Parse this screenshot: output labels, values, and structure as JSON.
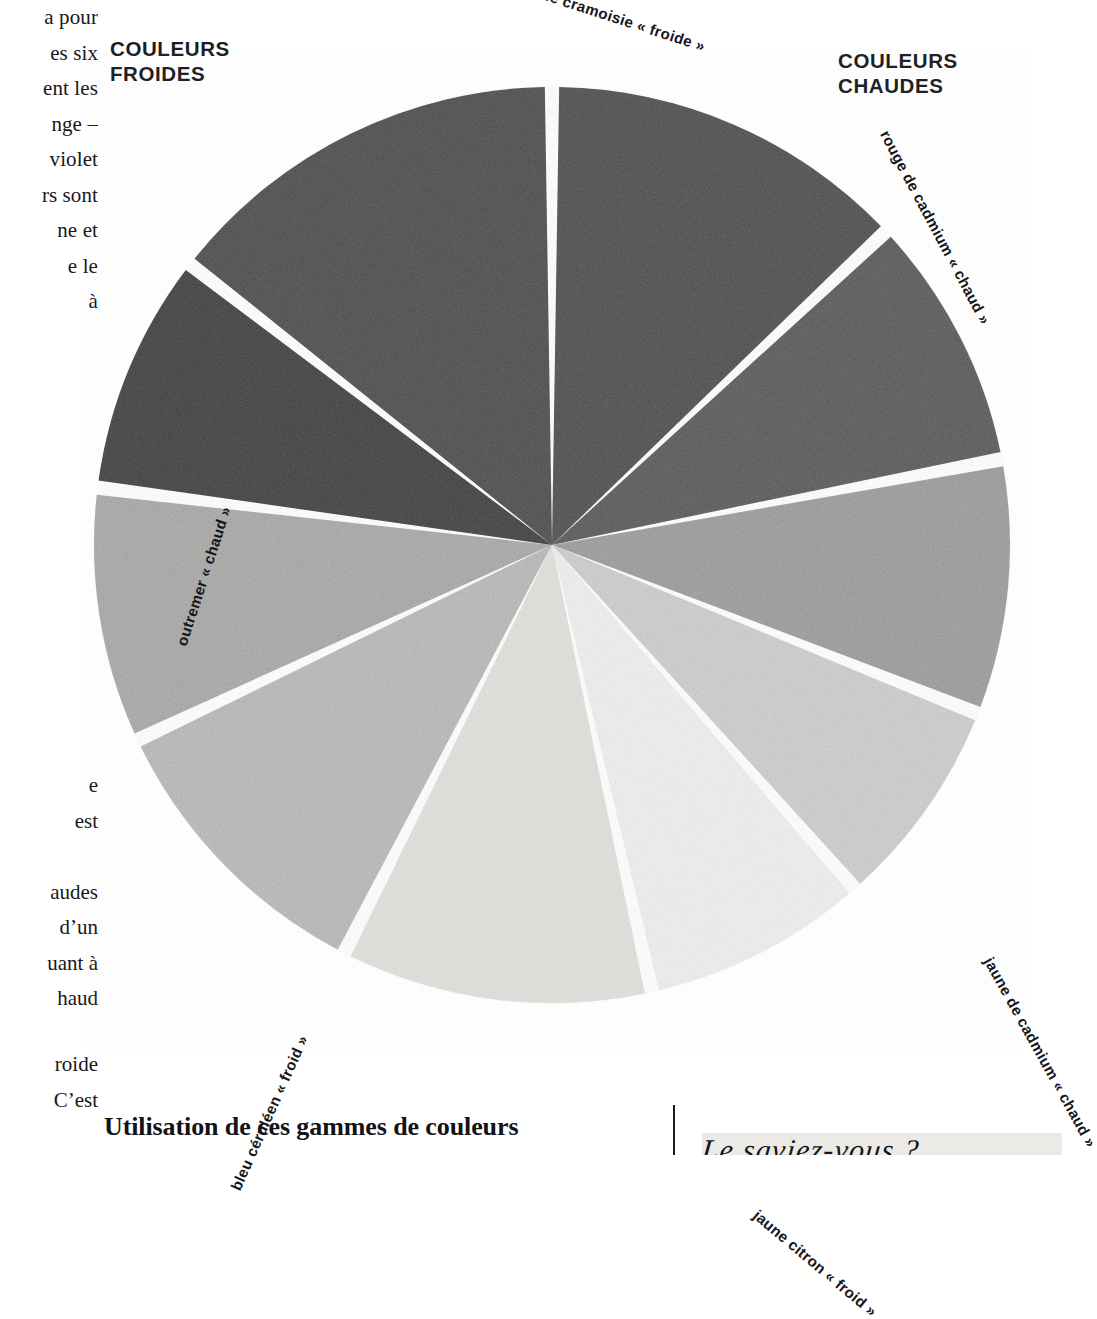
{
  "headings": {
    "cold": "COULEURS\nFROIDES",
    "cold_line1": "COULEURS",
    "cold_line2": "FROIDES",
    "warm_line1": "COULEURS",
    "warm_line2": "CHAUDES"
  },
  "left_column_block1": [
    "a pour",
    "es six",
    "ent les",
    "nge –",
    "violet",
    "rs sont",
    "ne et",
    "e le",
    "à"
  ],
  "left_column_block2": [
    "e",
    "est",
    "",
    "audes",
    "d’un",
    "uant à",
    "haud"
  ],
  "left_column_block3": [
    "roide",
    "C’est"
  ],
  "bottom": {
    "heading": "Utilisation de ces gammes de couleurs",
    "sidebar_note": "Le saviez-vous ?"
  },
  "chart_data": {
    "type": "pie",
    "legend_position": "around-slices",
    "center": [
      466,
      495
    ],
    "radius": 458,
    "note": "Grayscale reproduction of a painted colour wheel; values are slice angular sizes in degrees.",
    "categories": [
      "alizarine cramoisie « froide »",
      "rouge de cadmium « chaud »",
      "orange",
      "jaune de cadmium « chaud »",
      "jaune citron « froid »",
      "vert",
      "bleu céruléen « froid »",
      "outremer « chaud »",
      "violet",
      "magenta"
    ],
    "values": [
      52,
      36,
      36,
      30,
      32,
      44,
      42,
      36,
      34,
      58
    ],
    "start_angle_deg": 0,
    "slice_colors": [
      "#2c2c2c",
      "#3c3c3c",
      "#8d8d8d",
      "#c5c5c3",
      "#ececea",
      "#dcdbd7",
      "#aeaeac",
      "#9b9b99",
      "#111111",
      "#2a2a2a"
    ],
    "slice_labels": [
      {
        "text": "alizarine cramoisie « froide »",
        "visible": true
      },
      {
        "text": "rouge de cadmium « chaud »",
        "visible": true
      },
      {
        "text": "",
        "visible": false
      },
      {
        "text": "jaune de cadmium « chaud »",
        "visible": true
      },
      {
        "text": "jaune citron « froid »",
        "visible": true
      },
      {
        "text": "",
        "visible": false
      },
      {
        "text": "bleu céruléen « froid »",
        "visible": true
      },
      {
        "text": "outremer « chaud »",
        "visible": true
      },
      {
        "text": "",
        "visible": false
      },
      {
        "text": "",
        "visible": false
      }
    ],
    "separator_color": "#ffffff",
    "groups": [
      {
        "name": "COULEURS FROIDES",
        "side": "left"
      },
      {
        "name": "COULEURS CHAUDES",
        "side": "right"
      }
    ]
  },
  "labels": {
    "alizarine": "alizarine cramoisie « froide »",
    "rouge_cadmium": "rouge de cadmium « chaud »",
    "jaune_cadmium": "jaune de cadmium « chaud »",
    "jaune_citron": "jaune citron « froid »",
    "bleu_ceruleen": "bleu céruléen « froid »",
    "outremer": "outremer « chaud »"
  }
}
